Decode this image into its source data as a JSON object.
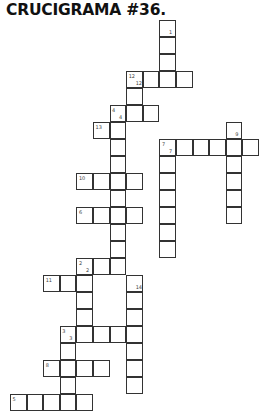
{
  "title": "CRUCIGRAMA #36.",
  "grid": {
    "origin_x": 10,
    "origin_y": 20,
    "cell_w": 16.6,
    "cell_h": 17
  },
  "words": [
    {
      "number": "1",
      "direction": "down",
      "col": 9,
      "row": 0,
      "length": 4
    },
    {
      "number": "12",
      "direction": "across",
      "col": 7,
      "row": 3,
      "length": 4
    },
    {
      "number": "12",
      "direction": "down",
      "col": 7,
      "row": 3,
      "length": 3
    },
    {
      "number": "4",
      "direction": "across",
      "col": 6,
      "row": 5,
      "length": 3
    },
    {
      "number": "4",
      "direction": "down",
      "col": 6,
      "row": 5,
      "length": 10
    },
    {
      "number": "13",
      "direction": "across",
      "col": 5,
      "row": 6,
      "length": 2
    },
    {
      "number": "7",
      "direction": "across",
      "col": 9,
      "row": 7,
      "length": 6
    },
    {
      "number": "7",
      "direction": "down",
      "col": 9,
      "row": 7,
      "length": 7
    },
    {
      "number": "9",
      "direction": "down",
      "col": 13,
      "row": 6,
      "length": 6
    },
    {
      "number": "10",
      "direction": "across",
      "col": 4,
      "row": 9,
      "length": 4
    },
    {
      "number": "6",
      "direction": "across",
      "col": 4,
      "row": 11,
      "length": 4
    },
    {
      "number": "2",
      "direction": "across",
      "col": 4,
      "row": 14,
      "length": 3
    },
    {
      "number": "2",
      "direction": "down",
      "col": 4,
      "row": 14,
      "length": 5
    },
    {
      "number": "11",
      "direction": "across",
      "col": 2,
      "row": 15,
      "length": 3
    },
    {
      "number": "14",
      "direction": "down",
      "col": 7,
      "row": 15,
      "length": 7
    },
    {
      "number": "3",
      "direction": "across",
      "col": 3,
      "row": 18,
      "length": 5
    },
    {
      "number": "3",
      "direction": "down",
      "col": 3,
      "row": 18,
      "length": 5
    },
    {
      "number": "8",
      "direction": "across",
      "col": 2,
      "row": 20,
      "length": 4
    },
    {
      "number": "5",
      "direction": "across",
      "col": 0,
      "row": 22,
      "length": 5
    }
  ]
}
